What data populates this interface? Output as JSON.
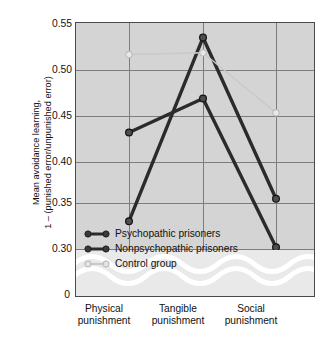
{
  "chart_data": {
    "type": "line",
    "title": "",
    "xlabel": "",
    "ylabel_line1": "Mean avoidance learning,",
    "ylabel_line2": "1 – (punished error/unpunished error)",
    "categories": [
      "Physical punishment",
      "Tangible punishment",
      "Social punishment"
    ],
    "category_lines": [
      [
        "Physical",
        "punishment"
      ],
      [
        "Tangible",
        "punishment"
      ],
      [
        "Social",
        "punishment"
      ]
    ],
    "series": [
      {
        "name": "Psychopathic prisoners",
        "values": [
          0.331,
          0.536,
          0.356
        ],
        "color": "#2b2b2b",
        "marker": "circle"
      },
      {
        "name": "Nonpsychopathic prisoners",
        "values": [
          0.43,
          0.468,
          0.302
        ],
        "color": "#2b2b2b",
        "marker": "circle"
      },
      {
        "name": "Control group",
        "values": [
          0.517,
          0.519,
          0.452
        ],
        "color": "#c9c9c9",
        "marker": "circle"
      }
    ],
    "ylim": [
      0.275,
      0.55
    ],
    "yticks": [
      "0.55",
      "0.50",
      "0.45",
      "0.40",
      "0.35",
      "0.30"
    ],
    "ytick_values": [
      0.55,
      0.5,
      0.45,
      0.4,
      0.35,
      0.3
    ],
    "axis_break": true,
    "zero_tick": "0",
    "grid": true,
    "legend_position": "inside-bottom-left",
    "plot_background": "#d4d4d4",
    "grid_color": "#7d7d7d",
    "axis_color": "#4a4a4a"
  },
  "legend": {
    "items": [
      {
        "label": "Psychopathic prisoners",
        "color": "#2b2b2b"
      },
      {
        "label": "Nonpsychopathic prisoners",
        "color": "#2b2b2b"
      },
      {
        "label": "Control group",
        "color": "#c9c9c9"
      }
    ]
  }
}
